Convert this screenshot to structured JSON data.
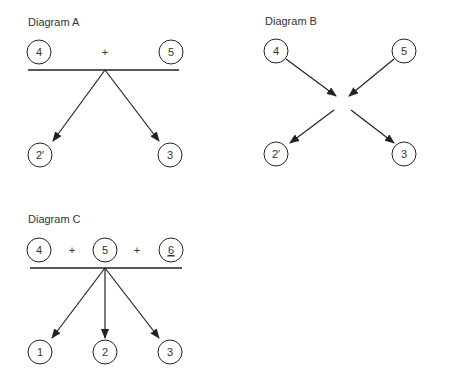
{
  "diagrams": {
    "a": {
      "title": "Diagram A",
      "reactants": [
        {
          "label": "4"
        },
        {
          "label": "5"
        }
      ],
      "operator": "+",
      "products": [
        {
          "label": "2′"
        },
        {
          "label": "3"
        }
      ]
    },
    "b": {
      "title": "Diagram B",
      "reactants": [
        {
          "label": "4"
        },
        {
          "label": "5"
        }
      ],
      "products": [
        {
          "label": "2′"
        },
        {
          "label": "3"
        }
      ]
    },
    "c": {
      "title": "Diagram C",
      "reactants": [
        {
          "label": "4"
        },
        {
          "label": "5"
        },
        {
          "label": "6",
          "underlined": true
        }
      ],
      "operators": [
        "+",
        "+"
      ],
      "products": [
        {
          "label": "1"
        },
        {
          "label": "2"
        },
        {
          "label": "3"
        }
      ]
    }
  },
  "colors": {
    "stroke": "#222222",
    "text": "#333333",
    "background": "#ffffff"
  }
}
